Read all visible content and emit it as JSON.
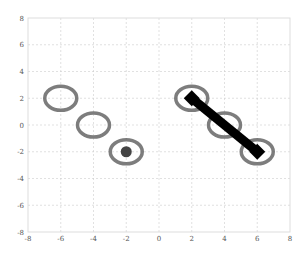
{
  "chart_data": {
    "type": "scatter",
    "title": "",
    "xlabel": "",
    "ylabel": "",
    "xlim": [
      -8,
      8
    ],
    "ylim": [
      -8,
      8
    ],
    "grid": true,
    "x_ticks": [
      "-8",
      "-6",
      "-4",
      "-2",
      "0",
      "2",
      "4",
      "6",
      "8"
    ],
    "y_ticks": [
      "8",
      "6",
      "4",
      "2",
      "0",
      "-2",
      "-4",
      "-6",
      "-8"
    ],
    "series": [
      {
        "name": "ellipses",
        "marker": "open-ellipse",
        "color": "#666666",
        "points": [
          {
            "x": -6,
            "y": 2
          },
          {
            "x": -4,
            "y": 0
          },
          {
            "x": -2,
            "y": -2
          },
          {
            "x": 2,
            "y": 2
          },
          {
            "x": 4,
            "y": 0
          },
          {
            "x": 6,
            "y": -2
          }
        ]
      },
      {
        "name": "dot",
        "marker": "filled-circle",
        "color": "#444444",
        "points": [
          {
            "x": -2,
            "y": -2
          }
        ]
      },
      {
        "name": "segment",
        "marker": "line-with-diamond-ends",
        "color": "#000000",
        "points": [
          {
            "x": 2,
            "y": 2
          },
          {
            "x": 6,
            "y": -2
          }
        ]
      }
    ]
  }
}
